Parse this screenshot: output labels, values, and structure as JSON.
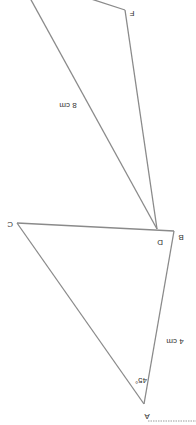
{
  "diagram": {
    "orientation": "rotated 180 degrees",
    "shapes": [
      {
        "name": "triangle-ABC",
        "vertices": [
          "A",
          "B",
          "C"
        ],
        "side_labels": [
          {
            "side": "AB",
            "text": "4 cm"
          }
        ],
        "angle_labels": [
          {
            "vertex": "A",
            "text": "45°"
          }
        ]
      },
      {
        "name": "triangle-DEF",
        "vertices": [
          "D",
          "F"
        ],
        "side_labels": [
          {
            "side": "DE",
            "text": "8 cm"
          }
        ]
      }
    ],
    "labels": {
      "A": "A",
      "B": "B",
      "C": "C",
      "D": "D",
      "F": "F",
      "ab_length": "4 cm",
      "angle_a": "45°",
      "de_length": "8 cm"
    },
    "colors": {
      "line": "#8a8a8a",
      "text": "#333333"
    }
  }
}
